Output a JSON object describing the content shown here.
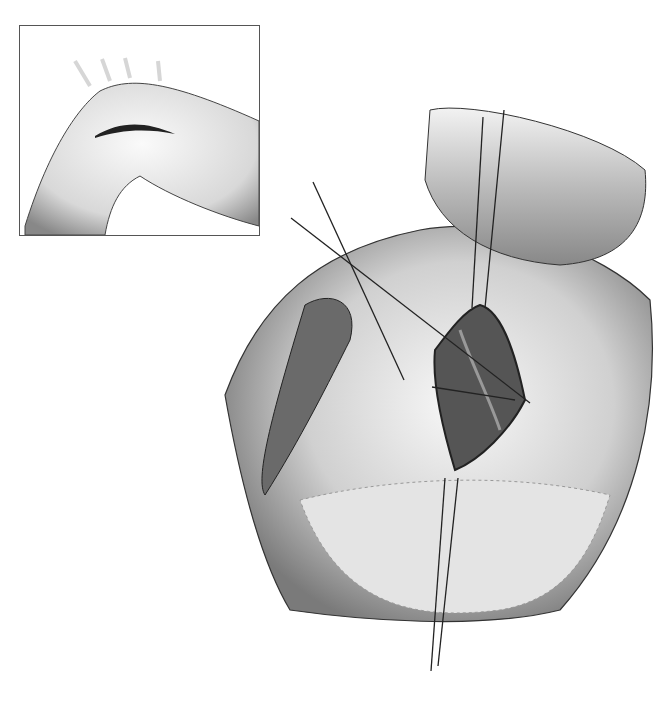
{
  "figure": {
    "inset": {
      "subject": "shoulder-incision"
    },
    "main": {
      "subject": "retracted-incision-with-sutures",
      "suture_count": 6
    },
    "colors": {
      "ink": "#222222",
      "shade": "#9a9a9a",
      "light": "#e6e6e6",
      "frame": "#555555"
    }
  }
}
